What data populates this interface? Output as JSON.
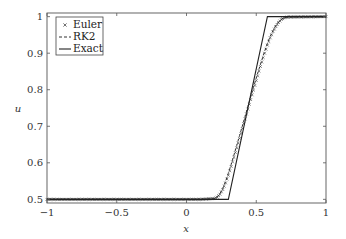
{
  "chart_data": {
    "type": "line",
    "title": "",
    "xlabel": "x",
    "ylabel": "u",
    "xlim": [
      -1,
      1
    ],
    "ylim": [
      0.49,
      1.01
    ],
    "grid": false,
    "legend_position": "top-left",
    "x_ticks": [
      {
        "value": -1,
        "label": "−1"
      },
      {
        "value": -0.5,
        "label": "−0.5"
      },
      {
        "value": 0,
        "label": "0"
      },
      {
        "value": 0.5,
        "label": "0.5"
      },
      {
        "value": 1,
        "label": "1"
      }
    ],
    "y_ticks": [
      {
        "value": 0.5,
        "label": "0.5"
      },
      {
        "value": 0.6,
        "label": "0.6"
      },
      {
        "value": 0.7,
        "label": "0.7"
      },
      {
        "value": 0.8,
        "label": "0.8"
      },
      {
        "value": 0.9,
        "label": "0.9"
      },
      {
        "value": 1.0,
        "label": "1"
      }
    ],
    "series": [
      {
        "name": "Euler",
        "style": "markers-x",
        "color": "#333333",
        "x": [
          -1,
          0.1,
          0.2,
          0.22,
          0.24,
          0.26,
          0.28,
          0.3,
          0.32,
          0.34,
          0.36,
          0.38,
          0.4,
          0.42,
          0.44,
          0.46,
          0.48,
          0.5,
          0.52,
          0.54,
          0.56,
          0.58,
          0.6,
          0.62,
          0.64,
          0.66,
          0.68,
          0.7,
          0.72,
          1
        ],
        "y": [
          0.5,
          0.5,
          0.502,
          0.506,
          0.514,
          0.527,
          0.545,
          0.566,
          0.59,
          0.615,
          0.641,
          0.667,
          0.694,
          0.72,
          0.747,
          0.773,
          0.799,
          0.825,
          0.851,
          0.876,
          0.9,
          0.922,
          0.942,
          0.959,
          0.973,
          0.984,
          0.992,
          0.997,
          0.999,
          1.0
        ]
      },
      {
        "name": "RK2",
        "style": "dashed",
        "color": "#333333",
        "x": [
          -1,
          0.1,
          0.2,
          0.22,
          0.24,
          0.26,
          0.28,
          0.3,
          0.32,
          0.34,
          0.36,
          0.38,
          0.4,
          0.42,
          0.44,
          0.46,
          0.48,
          0.5,
          0.52,
          0.54,
          0.56,
          0.58,
          0.6,
          0.62,
          0.64,
          0.66,
          0.68,
          0.7,
          0.72,
          1
        ],
        "y": [
          0.5,
          0.5,
          0.502,
          0.507,
          0.516,
          0.53,
          0.549,
          0.571,
          0.595,
          0.621,
          0.647,
          0.674,
          0.7,
          0.727,
          0.754,
          0.78,
          0.806,
          0.832,
          0.857,
          0.881,
          0.905,
          0.927,
          0.946,
          0.962,
          0.976,
          0.986,
          0.993,
          0.997,
          0.999,
          1.0
        ]
      },
      {
        "name": "Exact",
        "style": "solid",
        "color": "#222222",
        "x": [
          -1,
          0.3,
          0.58,
          1
        ],
        "y": [
          0.5,
          0.5,
          1.0,
          1.0
        ]
      }
    ]
  }
}
